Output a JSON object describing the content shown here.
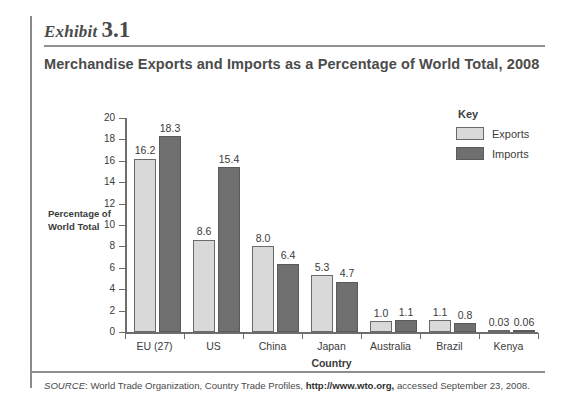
{
  "header": {
    "exhibit_word": "Exhibit",
    "exhibit_number": "3.1",
    "title": "Merchandise Exports and Imports as a Percentage of World Total, 2008"
  },
  "legend": {
    "title": "Key",
    "items": [
      {
        "label": "Exports",
        "color": "#d9d9d9"
      },
      {
        "label": "Imports",
        "color": "#6f6f6f"
      }
    ]
  },
  "source": {
    "prefix": "SOURCE",
    "text_before": ": World Trade Organization, Country Trade Profiles, ",
    "url": "http://www.wto.org,",
    "text_after": " accessed September 23, 2008."
  },
  "chart_data": {
    "type": "bar",
    "title": "Merchandise Exports and Imports as a Percentage of World Total, 2008",
    "xlabel": "Country",
    "ylabel": "Percentage of World Total",
    "ylim": [
      0,
      20
    ],
    "yticks": [
      0,
      2,
      4,
      6,
      8,
      10,
      12,
      14,
      16,
      18,
      20
    ],
    "grid": false,
    "legend_position": "top-right",
    "categories": [
      "EU (27)",
      "US",
      "China",
      "Japan",
      "Australia",
      "Brazil",
      "Kenya"
    ],
    "series": [
      {
        "name": "Exports",
        "color": "#d9d9d9",
        "values": [
          16.2,
          8.6,
          8.0,
          5.3,
          1.0,
          1.1,
          0.03
        ],
        "labels": [
          "16.2",
          "8.6",
          "8.0",
          "5.3",
          "1.0",
          "1.1",
          "0.03"
        ]
      },
      {
        "name": "Imports",
        "color": "#6f6f6f",
        "values": [
          18.3,
          15.4,
          6.4,
          4.7,
          1.1,
          0.8,
          0.06
        ],
        "labels": [
          "18.3",
          "15.4",
          "6.4",
          "4.7",
          "1.1",
          "0.8",
          "0.06"
        ]
      }
    ]
  }
}
